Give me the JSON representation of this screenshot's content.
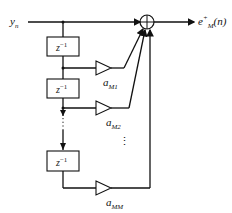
{
  "diagram": {
    "type": "lattice-predictor-block-diagram",
    "input": {
      "symbol": "y",
      "subscript": "n"
    },
    "output": {
      "symbol": "e",
      "superscript": "+",
      "subscript": "M",
      "argument": "(n)"
    },
    "delay_blocks": [
      {
        "base": "z",
        "exp": "−1"
      },
      {
        "base": "z",
        "exp": "−1"
      },
      {
        "base": "z",
        "exp": "−1"
      }
    ],
    "coefficients": [
      {
        "symbol": "a",
        "subscript": "M1"
      },
      {
        "symbol": "a",
        "subscript": "M2"
      },
      {
        "symbol": "a",
        "subscript": "MM"
      }
    ],
    "summer_symbol": "⊕",
    "ellipsis": "⋮",
    "colors": {
      "stroke": "#111111",
      "background": "#ffffff"
    }
  }
}
